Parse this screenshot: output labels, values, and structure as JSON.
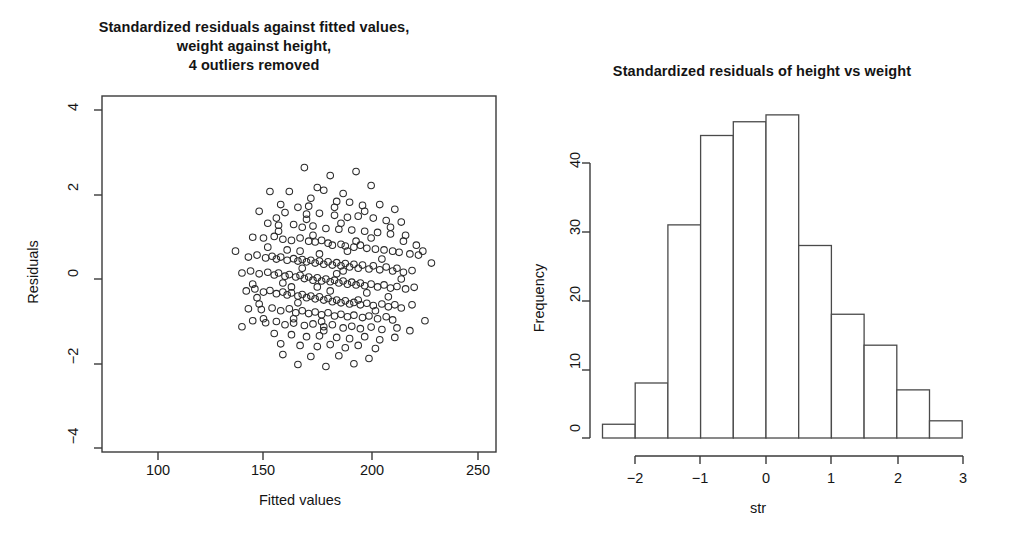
{
  "figure": {
    "background": "#ffffff",
    "ink_color": "#1a1a1a"
  },
  "panels": {
    "scatter": {
      "title_line1": "Standardized residuals against fitted values,",
      "title_line2": "weight against height,",
      "title_line3": "4 outliers removed",
      "xlabel": "Fitted values",
      "ylabel": "Residuals"
    },
    "histogram": {
      "title": "Standardized residuals of height vs weight",
      "xlabel": "str",
      "ylabel": "Frequency"
    }
  },
  "chart_data": [
    {
      "type": "scatter",
      "title": "Standardized residuals against fitted values, weight against height, 4 outliers removed",
      "xlabel": "Fitted values",
      "ylabel": "Residuals",
      "xlim": [
        75,
        258
      ],
      "ylim": [
        -4.6,
        4.35
      ],
      "xticks": [
        100,
        150,
        200,
        250
      ],
      "yticks": [
        4,
        2,
        0,
        -2,
        -4
      ],
      "grid": false,
      "legend": null,
      "marker": "open-circle",
      "points": [
        [
          169,
          2.55
        ],
        [
          181,
          2.35
        ],
        [
          193,
          2.45
        ],
        [
          153,
          1.95
        ],
        [
          162,
          1.95
        ],
        [
          175,
          2.05
        ],
        [
          178,
          1.98
        ],
        [
          187,
          1.9
        ],
        [
          200,
          2.1
        ],
        [
          172,
          1.78
        ],
        [
          184,
          1.7
        ],
        [
          190,
          1.68
        ],
        [
          158,
          1.62
        ],
        [
          166,
          1.55
        ],
        [
          196,
          1.6
        ],
        [
          204,
          1.62
        ],
        [
          211,
          1.5
        ],
        [
          148,
          1.45
        ],
        [
          160,
          1.42
        ],
        [
          170,
          1.38
        ],
        [
          176,
          1.4
        ],
        [
          183,
          1.35
        ],
        [
          189,
          1.3
        ],
        [
          194,
          1.33
        ],
        [
          201,
          1.28
        ],
        [
          207,
          1.22
        ],
        [
          214,
          1.18
        ],
        [
          152,
          1.15
        ],
        [
          157,
          1.1
        ],
        [
          164,
          1.12
        ],
        [
          168,
          1.05
        ],
        [
          173,
          1.08
        ],
        [
          179,
          1.02
        ],
        [
          185,
          1.0
        ],
        [
          191,
          0.98
        ],
        [
          197,
          0.95
        ],
        [
          203,
          0.92
        ],
        [
          209,
          0.88
        ],
        [
          216,
          0.85
        ],
        [
          145,
          0.8
        ],
        [
          150,
          0.78
        ],
        [
          155,
          0.82
        ],
        [
          159,
          0.75
        ],
        [
          163,
          0.72
        ],
        [
          167,
          0.78
        ],
        [
          171,
          0.7
        ],
        [
          174,
          0.68
        ],
        [
          177,
          0.72
        ],
        [
          180,
          0.65
        ],
        [
          182,
          0.6
        ],
        [
          186,
          0.62
        ],
        [
          188,
          0.58
        ],
        [
          192,
          0.55
        ],
        [
          195,
          0.6
        ],
        [
          198,
          0.52
        ],
        [
          202,
          0.5
        ],
        [
          206,
          0.48
        ],
        [
          210,
          0.45
        ],
        [
          213,
          0.42
        ],
        [
          218,
          0.38
        ],
        [
          222,
          0.35
        ],
        [
          143,
          0.3
        ],
        [
          147,
          0.35
        ],
        [
          151,
          0.28
        ],
        [
          154,
          0.32
        ],
        [
          156,
          0.25
        ],
        [
          158,
          0.3
        ],
        [
          161,
          0.22
        ],
        [
          164,
          0.26
        ],
        [
          166,
          0.2
        ],
        [
          168,
          0.24
        ],
        [
          170,
          0.18
        ],
        [
          172,
          0.22
        ],
        [
          174,
          0.15
        ],
        [
          176,
          0.2
        ],
        [
          178,
          0.12
        ],
        [
          180,
          0.18
        ],
        [
          182,
          0.1
        ],
        [
          184,
          0.16
        ],
        [
          186,
          0.08
        ],
        [
          188,
          0.14
        ],
        [
          190,
          0.05
        ],
        [
          192,
          0.12
        ],
        [
          194,
          0.02
        ],
        [
          196,
          0.1
        ],
        [
          199,
          0.0
        ],
        [
          201,
          0.08
        ],
        [
          204,
          -0.02
        ],
        [
          207,
          0.05
        ],
        [
          210,
          -0.05
        ],
        [
          212,
          0.02
        ],
        [
          215,
          -0.08
        ],
        [
          219,
          -0.04
        ],
        [
          140,
          -0.1
        ],
        [
          144,
          -0.05
        ],
        [
          148,
          -0.12
        ],
        [
          152,
          -0.08
        ],
        [
          155,
          -0.15
        ],
        [
          157,
          -0.1
        ],
        [
          160,
          -0.18
        ],
        [
          162,
          -0.14
        ],
        [
          165,
          -0.2
        ],
        [
          167,
          -0.16
        ],
        [
          169,
          -0.24
        ],
        [
          171,
          -0.2
        ],
        [
          173,
          -0.28
        ],
        [
          175,
          -0.22
        ],
        [
          177,
          -0.3
        ],
        [
          179,
          -0.25
        ],
        [
          181,
          -0.32
        ],
        [
          183,
          -0.28
        ],
        [
          185,
          -0.35
        ],
        [
          187,
          -0.3
        ],
        [
          189,
          -0.38
        ],
        [
          191,
          -0.33
        ],
        [
          193,
          -0.4
        ],
        [
          195,
          -0.35
        ],
        [
          197,
          -0.42
        ],
        [
          200,
          -0.38
        ],
        [
          203,
          -0.45
        ],
        [
          206,
          -0.4
        ],
        [
          209,
          -0.48
        ],
        [
          212,
          -0.44
        ],
        [
          216,
          -0.5
        ],
        [
          220,
          -0.46
        ],
        [
          142,
          -0.55
        ],
        [
          146,
          -0.5
        ],
        [
          150,
          -0.58
        ],
        [
          153,
          -0.54
        ],
        [
          156,
          -0.62
        ],
        [
          159,
          -0.58
        ],
        [
          161,
          -0.65
        ],
        [
          163,
          -0.6
        ],
        [
          166,
          -0.68
        ],
        [
          168,
          -0.64
        ],
        [
          170,
          -0.72
        ],
        [
          172,
          -0.68
        ],
        [
          174,
          -0.75
        ],
        [
          176,
          -0.7
        ],
        [
          178,
          -0.78
        ],
        [
          180,
          -0.74
        ],
        [
          182,
          -0.82
        ],
        [
          184,
          -0.78
        ],
        [
          186,
          -0.85
        ],
        [
          188,
          -0.8
        ],
        [
          190,
          -0.88
        ],
        [
          192,
          -0.84
        ],
        [
          195,
          -0.9
        ],
        [
          198,
          -0.86
        ],
        [
          201,
          -0.92
        ],
        [
          205,
          -0.88
        ],
        [
          208,
          -0.95
        ],
        [
          211,
          -0.9
        ],
        [
          214,
          -0.98
        ],
        [
          149,
          -1.02
        ],
        [
          154,
          -0.98
        ],
        [
          158,
          -1.05
        ],
        [
          162,
          -1.0
        ],
        [
          165,
          -1.1
        ],
        [
          168,
          -1.05
        ],
        [
          171,
          -1.12
        ],
        [
          174,
          -1.08
        ],
        [
          177,
          -1.15
        ],
        [
          180,
          -1.1
        ],
        [
          183,
          -1.18
        ],
        [
          186,
          -1.14
        ],
        [
          189,
          -1.2
        ],
        [
          192,
          -1.16
        ],
        [
          196,
          -1.22
        ],
        [
          199,
          -1.18
        ],
        [
          203,
          -1.25
        ],
        [
          207,
          -1.2
        ],
        [
          210,
          -1.28
        ],
        [
          145,
          -1.3
        ],
        [
          151,
          -1.35
        ],
        [
          156,
          -1.32
        ],
        [
          160,
          -1.4
        ],
        [
          164,
          -1.36
        ],
        [
          169,
          -1.42
        ],
        [
          173,
          -1.38
        ],
        [
          178,
          -1.45
        ],
        [
          182,
          -1.4
        ],
        [
          187,
          -1.48
        ],
        [
          191,
          -1.44
        ],
        [
          195,
          -1.5
        ],
        [
          200,
          -1.46
        ],
        [
          205,
          -1.52
        ],
        [
          212,
          -1.48
        ],
        [
          218,
          -1.55
        ],
        [
          155,
          -1.62
        ],
        [
          163,
          -1.65
        ],
        [
          170,
          -1.7
        ],
        [
          176,
          -1.68
        ],
        [
          184,
          -1.72
        ],
        [
          190,
          -1.75
        ],
        [
          197,
          -1.7
        ],
        [
          204,
          -1.78
        ],
        [
          211,
          -1.72
        ],
        [
          158,
          -1.88
        ],
        [
          167,
          -1.92
        ],
        [
          175,
          -1.95
        ],
        [
          181,
          -1.9
        ],
        [
          188,
          -1.98
        ],
        [
          194,
          -1.92
        ],
        [
          202,
          -2.0
        ],
        [
          159,
          -2.15
        ],
        [
          172,
          -2.2
        ],
        [
          185,
          -2.18
        ],
        [
          199,
          -2.25
        ],
        [
          166,
          -2.4
        ],
        [
          179,
          -2.45
        ],
        [
          192,
          -2.38
        ],
        [
          150,
          -1.25
        ],
        [
          147,
          -0.72
        ],
        [
          143,
          -1.0
        ],
        [
          225,
          -1.3
        ],
        [
          228,
          0.15
        ],
        [
          221,
          0.6
        ],
        [
          137,
          0.45
        ],
        [
          176,
          0.38
        ],
        [
          184,
          -0.12
        ],
        [
          167,
          0.45
        ],
        [
          159,
          -0.35
        ],
        [
          193,
          0.7
        ],
        [
          205,
          0.25
        ],
        [
          198,
          -0.6
        ],
        [
          186,
          1.15
        ],
        [
          178,
          -1.55
        ],
        [
          170,
          1.25
        ],
        [
          163,
          -0.45
        ],
        [
          152,
          0.55
        ],
        [
          145,
          -0.38
        ],
        [
          208,
          -0.7
        ],
        [
          215,
          0.7
        ],
        [
          189,
          0.45
        ],
        [
          181,
          -0.55
        ],
        [
          173,
          0.85
        ],
        [
          166,
          -0.85
        ],
        [
          157,
          0.95
        ],
        [
          200,
          0.78
        ],
        [
          194,
          -0.78
        ],
        [
          187,
          -0.05
        ],
        [
          175,
          -0.45
        ],
        [
          168,
          0.02
        ],
        [
          161,
          0.48
        ],
        [
          197,
          1.45
        ],
        [
          209,
          1.05
        ],
        [
          202,
          -1.05
        ],
        [
          183,
          1.55
        ],
        [
          177,
          -1.32
        ],
        [
          171,
          1.58
        ],
        [
          164,
          -1.25
        ],
        [
          156,
          1.28
        ],
        [
          148,
          -0.88
        ],
        [
          214,
          -0.25
        ],
        [
          219,
          -0.9
        ],
        [
          224,
          0.45
        ],
        [
          140,
          -1.45
        ]
      ]
    },
    {
      "type": "bar",
      "subtype": "histogram",
      "title": "Standardized residuals of height vs weight",
      "xlabel": "str",
      "ylabel": "Frequency",
      "xticks": [
        -2,
        -1,
        0,
        1,
        2,
        3
      ],
      "yticks": [
        0,
        10,
        20,
        30,
        40
      ],
      "xlim": [
        -2.6,
        3.1
      ],
      "ylim": [
        0,
        49
      ],
      "grid": false,
      "bin_width": 0.5,
      "bin_edges": [
        -2.5,
        -2.0,
        -1.5,
        -1.0,
        -0.5,
        0.0,
        0.5,
        1.0,
        1.5,
        2.0,
        2.5,
        3.0
      ],
      "categories": [
        "-2.5..-2.0",
        "-2.0..-1.5",
        "-1.5..-1.0",
        "-1.0..-0.5",
        "-0.5..0.0",
        "0.0..0.5",
        "0.5..1.0",
        "1.0..1.5",
        "1.5..2.0",
        "2.0..2.5",
        "2.5..3.0"
      ],
      "values": [
        2,
        8,
        31,
        44,
        46,
        47,
        28,
        18,
        13.5,
        7,
        2.5
      ]
    }
  ]
}
